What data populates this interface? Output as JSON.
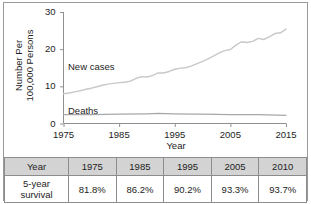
{
  "chart_data": {
    "type": "line",
    "title": "",
    "xlabel": "Year",
    "ylabel": "Number Per 100,000 Persons",
    "ylabel_lines": [
      "Number Per",
      "100,000 Persons"
    ],
    "xlim": [
      1975,
      2015
    ],
    "ylim": [
      0,
      30
    ],
    "xticks": [
      1975,
      1985,
      1995,
      2005,
      2015
    ],
    "yticks": [
      0,
      10,
      20,
      30
    ],
    "grid": false,
    "legend_position": "inline-annotation",
    "line_color": "#c8c8c8",
    "series": [
      {
        "name": "New cases",
        "label_text": "New cases",
        "x": [
          1975,
          1976,
          1977,
          1978,
          1979,
          1980,
          1981,
          1982,
          1983,
          1984,
          1985,
          1986,
          1987,
          1988,
          1989,
          1990,
          1991,
          1992,
          1993,
          1994,
          1995,
          1996,
          1997,
          1998,
          1999,
          2000,
          2001,
          2002,
          2003,
          2004,
          2005,
          2006,
          2007,
          2008,
          2009,
          2010,
          2011,
          2012,
          2013,
          2014,
          2015
        ],
        "values": [
          8.0,
          8.2,
          8.5,
          8.8,
          9.2,
          9.5,
          9.9,
          10.3,
          10.6,
          10.8,
          11.0,
          11.1,
          11.4,
          12.1,
          12.6,
          12.5,
          12.9,
          13.6,
          13.6,
          14.0,
          14.6,
          14.9,
          15.0,
          15.5,
          16.1,
          16.7,
          17.4,
          18.2,
          19.0,
          19.6,
          19.9,
          21.1,
          22.0,
          21.8,
          22.1,
          22.9,
          22.6,
          23.3,
          24.2,
          24.4,
          25.4
        ]
      },
      {
        "name": "Deaths",
        "label_text": "Deaths",
        "x": [
          1975,
          1980,
          1985,
          1990,
          1992,
          1995,
          1998,
          2000,
          2005,
          2010,
          2015
        ],
        "values": [
          2.4,
          2.4,
          2.5,
          2.6,
          2.7,
          2.6,
          2.5,
          2.5,
          2.4,
          2.4,
          2.2
        ]
      }
    ]
  },
  "table": {
    "header_label": "Year",
    "row_label_lines": [
      "5-year",
      "survival"
    ],
    "years": [
      "1975",
      "1985",
      "1995",
      "2005",
      "2010"
    ],
    "survival": [
      "81.8%",
      "86.2%",
      "90.2%",
      "93.3%",
      "93.7%"
    ],
    "header_bg": "#d3d3d3",
    "border_color": "#8c8c8c"
  }
}
